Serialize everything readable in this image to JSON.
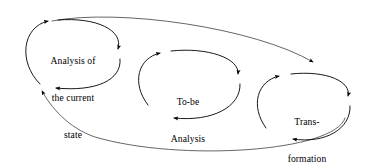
{
  "diagram": {
    "background_color": "#ffffff",
    "stroke_color": "#000000",
    "nodes": [
      {
        "id": "analysis-of-current-state",
        "label_line1": "Analysis of",
        "label_line2": "the current",
        "label_line3": "state",
        "label": "Analysis of the current state",
        "shape": "ellipse",
        "cx": 73,
        "cy": 56,
        "rx": 55,
        "ry": 36
      },
      {
        "id": "to-be-analysis",
        "label_line1": "To-be",
        "label_line2": "Analysis",
        "label": "To-be Analysis",
        "shape": "ellipse",
        "cx": 188,
        "cy": 85,
        "rx": 53,
        "ry": 40
      },
      {
        "id": "transformation",
        "label_line1": "Trans-",
        "label_line2": "formation",
        "label": "Trans-formation",
        "shape": "ellipse",
        "cx": 307,
        "cy": 108,
        "rx": 53,
        "ry": 40
      }
    ],
    "loops": [
      {
        "id": "analysis-loop",
        "around": "analysis-of-current-state",
        "direction": "clockwise",
        "arrowheads": 3
      },
      {
        "id": "tobe-loop",
        "around": "to-be-analysis",
        "direction": "clockwise",
        "arrowheads": 3
      },
      {
        "id": "transformation-loop",
        "around": "transformation",
        "direction": "clockwise",
        "arrowheads": 3
      }
    ],
    "outer_cycle": {
      "id": "outer-feedback-cycle",
      "description": "Large ellipse enclosing all three loops, top arc flows left to right, bottom arc returns right to left",
      "top_arc_arrowhead": "points-right-at-analysis",
      "bottom_arc_arrowhead": "points-left-at-analysis"
    }
  }
}
